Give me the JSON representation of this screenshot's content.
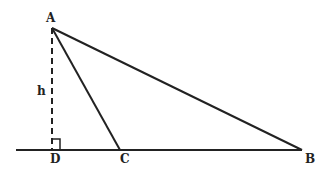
{
  "diagram": {
    "type": "geometry-triangle-altitude",
    "points": {
      "A": {
        "label": "A",
        "x": 52,
        "y": 28
      },
      "B": {
        "label": "B",
        "x": 302,
        "y": 150
      },
      "C": {
        "label": "C",
        "x": 120,
        "y": 150
      },
      "D": {
        "label": "D",
        "x": 52,
        "y": 150
      }
    },
    "altitude_label": "h",
    "stroke_color": "#222222",
    "background": "#ffffff"
  }
}
